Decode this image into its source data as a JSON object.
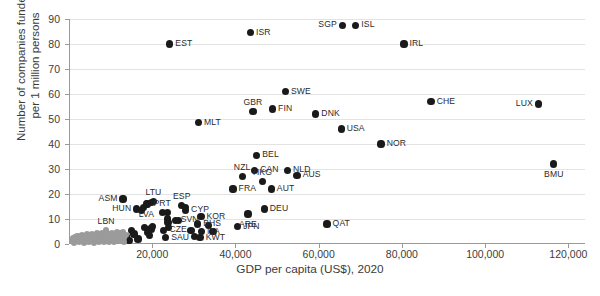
{
  "chart_data": {
    "type": "scatter",
    "title": "",
    "xlabel": "GDP per capita (US$), 2020",
    "ylabel_line1": "Number of companies funded",
    "ylabel_line2": "per 1 million persons",
    "xlim": [
      0,
      124000
    ],
    "ylim": [
      0,
      90
    ],
    "grid": true,
    "legend": "none",
    "xticks": [
      {
        "value": 20000,
        "label": "20,000"
      },
      {
        "value": 40000,
        "label": "40,000"
      },
      {
        "value": 60000,
        "label": "60,000"
      },
      {
        "value": 80000,
        "label": "80,000"
      },
      {
        "value": 100000,
        "label": "100,000"
      },
      {
        "value": 120000,
        "label": "120,000"
      }
    ],
    "yticks": [
      {
        "value": 0,
        "label": "0"
      },
      {
        "value": 10,
        "label": "10"
      },
      {
        "value": 20,
        "label": "20"
      },
      {
        "value": 30,
        "label": "30"
      },
      {
        "value": 40,
        "label": "40"
      },
      {
        "value": 50,
        "label": "50"
      },
      {
        "value": 60,
        "label": "60"
      },
      {
        "value": 70,
        "label": "70"
      },
      {
        "value": 80,
        "label": "80"
      },
      {
        "value": 90,
        "label": "90"
      }
    ],
    "series": [
      {
        "name": "Labelled countries",
        "color": "#1a1a1a",
        "points": [
          {
            "label": "EST",
            "x": 24200,
            "y": 80.0,
            "lpos": "right"
          },
          {
            "label": "ISR",
            "x": 43600,
            "y": 84.5,
            "lpos": "right"
          },
          {
            "label": "SGP",
            "x": 65700,
            "y": 87.5,
            "lpos": "left"
          },
          {
            "label": "ISL",
            "x": 68900,
            "y": 87.5,
            "lpos": "right"
          },
          {
            "label": "IRL",
            "x": 80500,
            "y": 80.0,
            "lpos": "right"
          },
          {
            "label": "SWE",
            "x": 52000,
            "y": 61.0,
            "lpos": "right"
          },
          {
            "label": "CHE",
            "x": 87000,
            "y": 57.0,
            "lpos": "right"
          },
          {
            "label": "LUX",
            "x": 112800,
            "y": 56.0,
            "lpos": "left"
          },
          {
            "label": "FIN",
            "x": 48900,
            "y": 54.0,
            "lpos": "right"
          },
          {
            "label": "GBR",
            "x": 44200,
            "y": 53.0,
            "lpos": "above"
          },
          {
            "label": "DNK",
            "x": 59300,
            "y": 52.0,
            "lpos": "right"
          },
          {
            "label": "MLT",
            "x": 31100,
            "y": 48.5,
            "lpos": "right"
          },
          {
            "label": "USA",
            "x": 65400,
            "y": 46.0,
            "lpos": "right"
          },
          {
            "label": "NOR",
            "x": 75000,
            "y": 40.0,
            "lpos": "right"
          },
          {
            "label": "BEL",
            "x": 45100,
            "y": 35.5,
            "lpos": "right"
          },
          {
            "label": "BMU",
            "x": 116500,
            "y": 32.0,
            "lpos": "below"
          },
          {
            "label": "CAN",
            "x": 44600,
            "y": 29.5,
            "lpos": "right"
          },
          {
            "label": "NLD",
            "x": 52500,
            "y": 29.5,
            "lpos": "right"
          },
          {
            "label": "AUS",
            "x": 54800,
            "y": 27.5,
            "lpos": "right"
          },
          {
            "label": "NZL",
            "x": 41600,
            "y": 27.0,
            "lpos": "above"
          },
          {
            "label": "HKG",
            "x": 46500,
            "y": 25.0,
            "lpos": "above"
          },
          {
            "label": "AUT",
            "x": 48600,
            "y": 22.0,
            "lpos": "right"
          },
          {
            "label": "FRA",
            "x": 39400,
            "y": 22.0,
            "lpos": "right"
          },
          {
            "label": "LTU",
            "x": 20300,
            "y": 17.0,
            "lpos": "above"
          },
          {
            "label": "ASM",
            "x": 13000,
            "y": 18.0,
            "lpos": "left"
          },
          {
            "label": "ESP",
            "x": 27100,
            "y": 15.5,
            "lpos": "above"
          },
          {
            "label": "LVA",
            "x": 18600,
            "y": 16.0,
            "lpos": "below"
          },
          {
            "label": "CYP",
            "x": 28000,
            "y": 13.5,
            "lpos": "right"
          },
          {
            "label": "DEU",
            "x": 46900,
            "y": 14.0,
            "lpos": "right"
          },
          {
            "label": "HUN",
            "x": 16300,
            "y": 14.0,
            "lpos": "left"
          },
          {
            "label": "PRT",
            "x": 22400,
            "y": 12.5,
            "lpos": "above"
          },
          {
            "label": "KOR",
            "x": 31700,
            "y": 11.0,
            "lpos": "right"
          },
          {
            "label": "ARE",
            "x": 43000,
            "y": 12.0,
            "lpos": "below"
          },
          {
            "label": "SVN",
            "x": 25500,
            "y": 9.5,
            "lpos": "right"
          },
          {
            "label": "BHS",
            "x": 30900,
            "y": 8.0,
            "lpos": "right"
          },
          {
            "label": "QAT",
            "x": 62000,
            "y": 8.0,
            "lpos": "right"
          },
          {
            "label": "JPN",
            "x": 40500,
            "y": 7.0,
            "lpos": "right"
          },
          {
            "label": "CZE",
            "x": 22800,
            "y": 5.5,
            "lpos": "right"
          },
          {
            "label": "ITA",
            "x": 31800,
            "y": 5.0,
            "lpos": "right"
          },
          {
            "label": "SAU",
            "x": 23200,
            "y": 2.5,
            "lpos": "right"
          },
          {
            "label": "KWT",
            "x": 31500,
            "y": 2.5,
            "lpos": "right"
          }
        ]
      },
      {
        "name": "Unlabelled countries (dark)",
        "color": "#1a1a1a",
        "points": [
          {
            "label": "",
            "x": 15000,
            "y": 5.5
          },
          {
            "label": "",
            "x": 15600,
            "y": 4.0
          },
          {
            "label": "",
            "x": 16600,
            "y": 2.0
          },
          {
            "label": "",
            "x": 17400,
            "y": 13.5
          },
          {
            "label": "",
            "x": 18000,
            "y": 14.5
          },
          {
            "label": "",
            "x": 18900,
            "y": 16.0
          },
          {
            "label": "",
            "x": 19900,
            "y": 16.5
          },
          {
            "label": "",
            "x": 18200,
            "y": 6.5
          },
          {
            "label": "",
            "x": 18900,
            "y": 4.5
          },
          {
            "label": "",
            "x": 19400,
            "y": 3.5
          },
          {
            "label": "",
            "x": 19700,
            "y": 6.0
          },
          {
            "label": "",
            "x": 20100,
            "y": 7.0
          },
          {
            "label": "",
            "x": 23600,
            "y": 12.5
          },
          {
            "label": "",
            "x": 23700,
            "y": 10.0
          },
          {
            "label": "",
            "x": 23800,
            "y": 8.5
          },
          {
            "label": "",
            "x": 23900,
            "y": 6.5
          },
          {
            "label": "",
            "x": 26400,
            "y": 9.5
          },
          {
            "label": "",
            "x": 27900,
            "y": 14.5
          },
          {
            "label": "",
            "x": 29300,
            "y": 5.5
          },
          {
            "label": "",
            "x": 30200,
            "y": 3.0
          },
          {
            "label": "",
            "x": 33600,
            "y": 7.5
          },
          {
            "label": "",
            "x": 34600,
            "y": 5.0
          },
          {
            "label": "",
            "x": 13900,
            "y": 3.0
          },
          {
            "label": "",
            "x": 14400,
            "y": 1.5
          }
        ]
      },
      {
        "name": "Low-income cluster (gray)",
        "color": "#9b9b9b",
        "points": [
          {
            "label": "LBN",
            "x": 8900,
            "y": 5.5,
            "lpos": "above"
          },
          {
            "label": "",
            "x": 800,
            "y": 1.2
          },
          {
            "label": "",
            "x": 1300,
            "y": 1.0
          },
          {
            "label": "",
            "x": 1700,
            "y": 1.6
          },
          {
            "label": "",
            "x": 2100,
            "y": 1.1
          },
          {
            "label": "",
            "x": 2400,
            "y": 2.2
          },
          {
            "label": "",
            "x": 2700,
            "y": 1.3
          },
          {
            "label": "",
            "x": 3000,
            "y": 2.0
          },
          {
            "label": "",
            "x": 3300,
            "y": 1.4
          },
          {
            "label": "",
            "x": 3600,
            "y": 2.6
          },
          {
            "label": "",
            "x": 3900,
            "y": 1.0
          },
          {
            "label": "",
            "x": 4200,
            "y": 2.1
          },
          {
            "label": "",
            "x": 4500,
            "y": 1.5
          },
          {
            "label": "",
            "x": 4800,
            "y": 2.9
          },
          {
            "label": "",
            "x": 5100,
            "y": 1.2
          },
          {
            "label": "",
            "x": 5400,
            "y": 2.3
          },
          {
            "label": "",
            "x": 5700,
            "y": 1.7
          },
          {
            "label": "",
            "x": 6000,
            "y": 3.0
          },
          {
            "label": "",
            "x": 6300,
            "y": 1.1
          },
          {
            "label": "",
            "x": 6600,
            "y": 2.4
          },
          {
            "label": "",
            "x": 6900,
            "y": 1.9
          },
          {
            "label": "",
            "x": 7200,
            "y": 3.2
          },
          {
            "label": "",
            "x": 7500,
            "y": 1.4
          },
          {
            "label": "",
            "x": 7800,
            "y": 2.6
          },
          {
            "label": "",
            "x": 8100,
            "y": 2.0
          },
          {
            "label": "",
            "x": 8400,
            "y": 3.4
          },
          {
            "label": "",
            "x": 8700,
            "y": 1.6
          },
          {
            "label": "",
            "x": 9000,
            "y": 2.8
          },
          {
            "label": "",
            "x": 9300,
            "y": 2.1
          },
          {
            "label": "",
            "x": 9600,
            "y": 3.6
          },
          {
            "label": "",
            "x": 9900,
            "y": 1.5
          },
          {
            "label": "",
            "x": 10200,
            "y": 2.7
          },
          {
            "label": "",
            "x": 10500,
            "y": 2.0
          },
          {
            "label": "",
            "x": 10800,
            "y": 3.3
          },
          {
            "label": "",
            "x": 11100,
            "y": 1.8
          },
          {
            "label": "",
            "x": 11400,
            "y": 2.5
          },
          {
            "label": "",
            "x": 11700,
            "y": 3.8
          },
          {
            "label": "",
            "x": 12000,
            "y": 2.2
          },
          {
            "label": "",
            "x": 12400,
            "y": 3.0
          },
          {
            "label": "",
            "x": 12800,
            "y": 4.2
          },
          {
            "label": "",
            "x": 13200,
            "y": 2.4
          },
          {
            "label": "",
            "x": 13700,
            "y": 3.5
          },
          {
            "label": "",
            "x": 1000,
            "y": 2.5
          },
          {
            "label": "",
            "x": 1500,
            "y": 3.0
          },
          {
            "label": "",
            "x": 2000,
            "y": 3.4
          },
          {
            "label": "",
            "x": 2600,
            "y": 3.2
          },
          {
            "label": "",
            "x": 3200,
            "y": 3.6
          },
          {
            "label": "",
            "x": 3800,
            "y": 3.1
          },
          {
            "label": "",
            "x": 4400,
            "y": 3.9
          },
          {
            "label": "",
            "x": 5000,
            "y": 3.5
          },
          {
            "label": "",
            "x": 5600,
            "y": 4.0
          },
          {
            "label": "",
            "x": 6200,
            "y": 3.7
          },
          {
            "label": "",
            "x": 6800,
            "y": 4.3
          },
          {
            "label": "",
            "x": 7400,
            "y": 3.9
          },
          {
            "label": "",
            "x": 8000,
            "y": 4.4
          },
          {
            "label": "",
            "x": 8600,
            "y": 4.0
          },
          {
            "label": "",
            "x": 9200,
            "y": 4.5
          },
          {
            "label": "",
            "x": 9800,
            "y": 4.1
          },
          {
            "label": "",
            "x": 10400,
            "y": 4.6
          },
          {
            "label": "",
            "x": 11000,
            "y": 4.2
          },
          {
            "label": "",
            "x": 11600,
            "y": 4.7
          },
          {
            "label": "",
            "x": 12200,
            "y": 4.3
          },
          {
            "label": "",
            "x": 12900,
            "y": 4.8
          },
          {
            "label": "",
            "x": 1200,
            "y": 0.6
          },
          {
            "label": "",
            "x": 2300,
            "y": 0.7
          },
          {
            "label": "",
            "x": 3500,
            "y": 0.5
          },
          {
            "label": "",
            "x": 4700,
            "y": 0.8
          },
          {
            "label": "",
            "x": 5900,
            "y": 0.6
          },
          {
            "label": "",
            "x": 7100,
            "y": 0.9
          },
          {
            "label": "",
            "x": 8300,
            "y": 0.7
          },
          {
            "label": "",
            "x": 9500,
            "y": 1.0
          },
          {
            "label": "",
            "x": 10700,
            "y": 0.8
          },
          {
            "label": "",
            "x": 11900,
            "y": 1.1
          },
          {
            "label": "",
            "x": 13100,
            "y": 0.9
          }
        ]
      }
    ]
  }
}
